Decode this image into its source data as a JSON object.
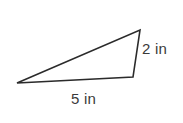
{
  "figure": {
    "kind": "geometry-triangle-diagram",
    "background_color": "#ffffff",
    "stroke_color": "#2b2b2b",
    "text_color": "#3a3a3a",
    "stroke_width": 1.6,
    "width": 183,
    "height": 123
  },
  "shape": {
    "name": "triangle",
    "fill": "none",
    "vertices": [
      {
        "id": "left-vertex",
        "x": 17,
        "y": 83
      },
      {
        "id": "top-right-vertex",
        "x": 140,
        "y": 30
      },
      {
        "id": "bottom-right-vertex",
        "x": 133,
        "y": 77
      }
    ],
    "points_attr": "17,83 140,30 133,77"
  },
  "labels": {
    "right_side": {
      "text": "2 in",
      "value": 2,
      "unit": "in",
      "describes": "short right side from top-right-vertex to bottom-right-vertex"
    },
    "base_side": {
      "text": "5 in",
      "value": 5,
      "unit": "in",
      "describes": "base from left-vertex to bottom-right-vertex"
    }
  }
}
